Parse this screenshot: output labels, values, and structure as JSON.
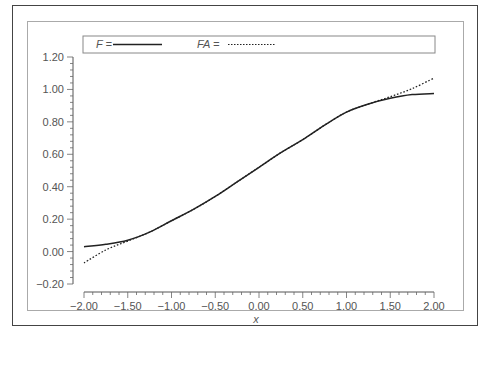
{
  "chart_data": {
    "type": "line",
    "title": "",
    "xlabel": "x",
    "ylabel": "",
    "xlim": [
      -2.0,
      2.0
    ],
    "ylim": [
      -0.2,
      1.2
    ],
    "grid": false,
    "legend_position": "top",
    "x_ticks": [
      "−2.00",
      "−1.50",
      "−1.00",
      "−0.50",
      "0.00",
      "0.50",
      "1.00",
      "1.50",
      "2.00"
    ],
    "y_ticks": [
      "−0.20",
      "0.00",
      "0.20",
      "0.40",
      "0.60",
      "0.80",
      "1.00",
      "1.20"
    ],
    "x": [
      -2.0,
      -1.75,
      -1.5,
      -1.25,
      -1.0,
      -0.75,
      -0.5,
      -0.25,
      0.0,
      0.25,
      0.5,
      0.75,
      1.0,
      1.25,
      1.5,
      1.75,
      2.0
    ],
    "series": [
      {
        "name": "F",
        "style": "solid",
        "values": [
          0.03,
          0.045,
          0.07,
          0.12,
          0.19,
          0.26,
          0.34,
          0.43,
          0.52,
          0.61,
          0.69,
          0.78,
          0.86,
          0.91,
          0.945,
          0.968,
          0.975
        ]
      },
      {
        "name": "FA",
        "style": "dotted",
        "values": [
          -0.07,
          0.01,
          0.065,
          0.12,
          0.19,
          0.26,
          0.34,
          0.43,
          0.52,
          0.61,
          0.69,
          0.78,
          0.86,
          0.91,
          0.955,
          1.005,
          1.07
        ]
      }
    ]
  },
  "legend": {
    "f_label": "F =",
    "fa_label": "FA ="
  },
  "axis": {
    "xlabel": "x"
  }
}
